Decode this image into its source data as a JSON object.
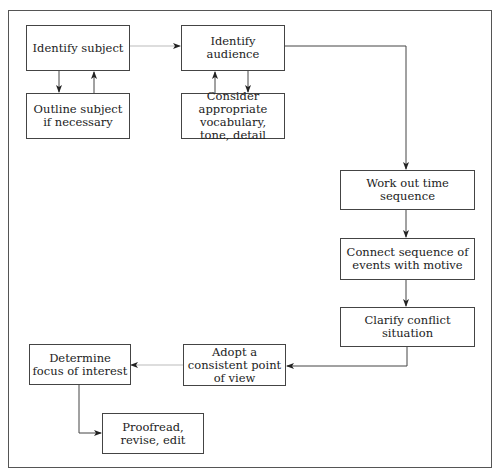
{
  "diagram": {
    "nodes": [
      {
        "id": "identify_subject",
        "label": "Identify subject"
      },
      {
        "id": "outline_subject",
        "label": "Outline subject if necessary"
      },
      {
        "id": "identify_audience",
        "label": "Identify audience"
      },
      {
        "id": "consider_vocab",
        "label": "Consider appropriate vocabulary, tone, detail"
      },
      {
        "id": "work_out_time",
        "label": "Work out time sequence"
      },
      {
        "id": "connect_sequence",
        "label": "Connect sequence of events with motive"
      },
      {
        "id": "clarify_conflict",
        "label": "Clarify conflict situation"
      },
      {
        "id": "adopt_pov",
        "label": "Adopt a consistent point of view"
      },
      {
        "id": "determine_focus",
        "label": "Determine focus of interest"
      },
      {
        "id": "proofread",
        "label": "Proofread, revise, edit"
      }
    ],
    "edges": [
      {
        "from": "identify_subject",
        "to": "identify_audience"
      },
      {
        "from": "identify_subject",
        "to": "outline_subject"
      },
      {
        "from": "outline_subject",
        "to": "identify_subject"
      },
      {
        "from": "identify_audience",
        "to": "consider_vocab"
      },
      {
        "from": "consider_vocab",
        "to": "identify_audience"
      },
      {
        "from": "identify_audience",
        "to": "work_out_time"
      },
      {
        "from": "work_out_time",
        "to": "connect_sequence"
      },
      {
        "from": "connect_sequence",
        "to": "clarify_conflict"
      },
      {
        "from": "clarify_conflict",
        "to": "adopt_pov"
      },
      {
        "from": "adopt_pov",
        "to": "determine_focus"
      },
      {
        "from": "determine_focus",
        "to": "proofread"
      }
    ]
  }
}
